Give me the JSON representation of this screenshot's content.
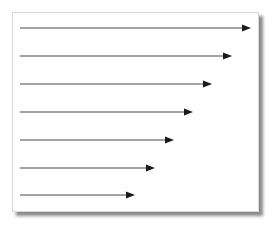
{
  "diagram": {
    "type": "arrow-list",
    "frame": {
      "x": 12,
      "y": 12,
      "width": 247,
      "height": 200,
      "border_color": "#d8d8d8",
      "shadow_color": "#8a8a8a"
    },
    "arrow_color": "#1a1a1a",
    "line_color": "#4a4a4a",
    "arrows": [
      {
        "x1": 20,
        "y": 28,
        "x2": 251
      },
      {
        "x1": 20,
        "y": 56,
        "x2": 232
      },
      {
        "x1": 20,
        "y": 84,
        "x2": 212
      },
      {
        "x1": 20,
        "y": 112,
        "x2": 193
      },
      {
        "x1": 20,
        "y": 140,
        "x2": 174
      },
      {
        "x1": 20,
        "y": 168,
        "x2": 155
      },
      {
        "x1": 20,
        "y": 195,
        "x2": 135
      }
    ]
  }
}
